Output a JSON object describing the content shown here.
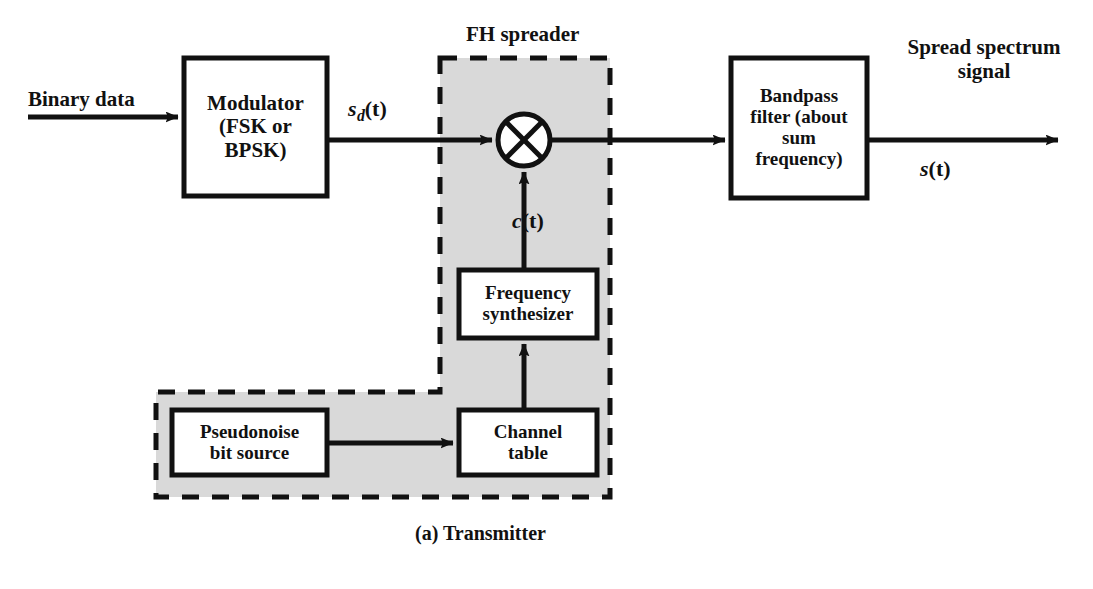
{
  "figure": {
    "caption": "(a) Transmitter",
    "group_title": "FH spreader",
    "colors": {
      "stroke": "#111111",
      "background": "#ffffff",
      "group_fill": "#d9d9d9",
      "box_fill": "#ffffff"
    }
  },
  "blocks": [
    {
      "id": "modulator",
      "label": "Modulator\n(FSK or\nBPSK)",
      "x": 184,
      "y": 58,
      "w": 143,
      "h": 138,
      "font_size": 21
    },
    {
      "id": "bandpass-filter",
      "label": "Bandpass\nfilter (about\nsum\nfrequency)",
      "x": 731,
      "y": 58,
      "w": 136,
      "h": 140,
      "font_size": 19
    },
    {
      "id": "frequency-synthesizer",
      "label": "Frequency\nsynthesizer",
      "x": 459,
      "y": 270,
      "w": 138,
      "h": 68,
      "font_size": 19
    },
    {
      "id": "channel-table",
      "label": "Channel\ntable",
      "x": 459,
      "y": 410,
      "w": 138,
      "h": 65,
      "font_size": 19
    },
    {
      "id": "pseudonoise-bit-source",
      "label": "Pseudonoise\nbit source",
      "x": 172,
      "y": 410,
      "w": 155,
      "h": 65,
      "font_size": 19
    }
  ],
  "multiplier": {
    "id": "multiplier",
    "symbol": "cross-in-circle",
    "cx": 524,
    "cy": 140,
    "r": 26
  },
  "signals": [
    {
      "id": "input-label",
      "text": "Binary data",
      "x": 28,
      "y": 88,
      "font_size": 21,
      "italic": false
    },
    {
      "id": "sd-label",
      "base": "s",
      "sub": "d",
      "tail": "(t)",
      "x": 348,
      "y": 96,
      "font_size": 22
    },
    {
      "id": "ct-label",
      "base": "c",
      "sub": "",
      "tail": "(t)",
      "x": 512,
      "y": 208,
      "font_size": 22
    },
    {
      "id": "output-label",
      "text": "Spread spectrum\nsignal",
      "x": 884,
      "y": 36,
      "font_size": 21,
      "italic": false
    },
    {
      "id": "st-label",
      "base": "s",
      "sub": "",
      "tail": "(t)",
      "x": 920,
      "y": 156,
      "font_size": 22
    }
  ],
  "group_region": {
    "title": "FH spreader",
    "title_x": 466,
    "title_y": 22,
    "title_font_size": 21
  },
  "caption_pos": {
    "x": 415,
    "y": 522,
    "font_size": 20
  }
}
